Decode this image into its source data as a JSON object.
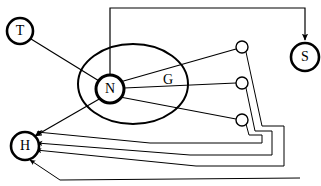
{
  "figure": {
    "type": "neural-circuit-diagram",
    "background_color": "#ffffff",
    "line_color": "#000000",
    "width": 321,
    "height": 186
  },
  "nodes": [
    {
      "id": "T",
      "label": "T",
      "cx": 20,
      "cy": 31,
      "r": 13,
      "stroke_width": 2.6,
      "style": "bold-circle"
    },
    {
      "id": "N",
      "label": "N",
      "cx": 110,
      "cy": 89,
      "r": 14,
      "stroke_width": 3.0,
      "style": "bold-circle"
    },
    {
      "id": "H",
      "label": "H",
      "cx": 25,
      "cy": 146,
      "r": 14,
      "stroke_width": 2.6,
      "style": "bold-circle"
    },
    {
      "id": "S",
      "label": "S",
      "cx": 305,
      "cy": 57,
      "r": 14,
      "stroke_width": 2.6,
      "style": "bold-circle"
    }
  ],
  "region": {
    "id": "G",
    "label": "G",
    "label_x": 168,
    "label_y": 81,
    "cx": 133,
    "cy": 84,
    "rx": 55,
    "ry": 40
  },
  "synapses": [
    {
      "id": "syn-1",
      "cx": 242,
      "cy": 47,
      "r": 6
    },
    {
      "id": "syn-2",
      "cx": 242,
      "cy": 83,
      "r": 6
    },
    {
      "id": "syn-3",
      "cx": 242,
      "cy": 120,
      "r": 6
    }
  ],
  "edges": [
    {
      "id": "edge-t-to-n",
      "from": "T",
      "to": "N",
      "arrow": false
    },
    {
      "id": "edge-n-to-s",
      "from": "N",
      "to": "S",
      "arrow": true
    },
    {
      "id": "edge-n-to-syn-1",
      "from": "N",
      "to": "syn-1",
      "arrow": false
    },
    {
      "id": "edge-n-to-syn-2",
      "from": "N",
      "to": "syn-2",
      "arrow": false
    },
    {
      "id": "edge-n-to-syn-3",
      "from": "N",
      "to": "syn-3",
      "arrow": false
    },
    {
      "id": "edge-n-to-h",
      "from": "N",
      "to": "H",
      "arrow": true
    },
    {
      "id": "edge-syn-1-to-h",
      "from": "syn-1",
      "to": "H",
      "arrow": true
    },
    {
      "id": "edge-syn-2-to-h",
      "from": "syn-2",
      "to": "H",
      "arrow": true
    },
    {
      "id": "edge-syn-3-to-h",
      "from": "syn-3",
      "to": "H",
      "arrow": true
    }
  ]
}
